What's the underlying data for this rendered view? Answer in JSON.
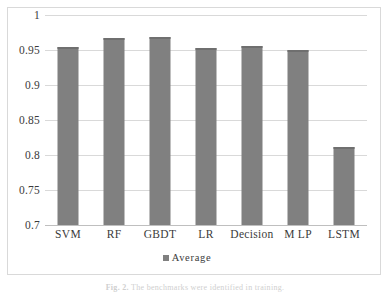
{
  "chart_data": {
    "type": "bar",
    "title": "",
    "xlabel": "",
    "ylabel": "",
    "categories": [
      "SVM",
      "RF",
      "GBDT",
      "LR",
      "Decision",
      "M LP",
      "LSTM"
    ],
    "series": [
      {
        "name": "Average",
        "values": [
          0.955,
          0.967,
          0.969,
          0.953,
          0.956,
          0.95,
          0.811
        ]
      }
    ],
    "values": [
      0.955,
      0.967,
      0.969,
      0.953,
      0.956,
      0.95,
      0.811
    ],
    "ylim": [
      0.7,
      1.0
    ],
    "ytick_values": [
      1,
      0.95,
      0.9,
      0.85,
      0.8,
      0.75,
      0.7
    ],
    "ytick_labels": [
      "1",
      "0.95",
      "0.9",
      "0.85",
      "0.8",
      "0.75",
      "0.7"
    ],
    "grid": true,
    "legend": {
      "position": "bottom",
      "entries": [
        "Average"
      ]
    },
    "colors": {
      "bar": "#808080",
      "bar_cap": "#6f6f6f",
      "gridline": "#d9d9d9",
      "frame": "#d9d9d9",
      "text": "#3b3b3b"
    }
  },
  "legend": {
    "label": "Average",
    "swatch_name": "average-series-swatch"
  },
  "caption": {
    "figure_number": "Fig. 2.",
    "text": "The benchmarks were identified in training."
  }
}
